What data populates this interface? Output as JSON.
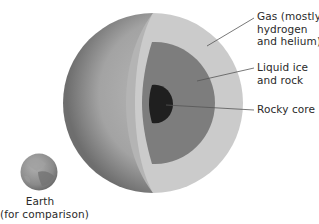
{
  "diagram": {
    "layers": [
      {
        "id": "gas",
        "label_lines": [
          "Gas (mostly",
          "hydrogen",
          "and helium)"
        ],
        "color": "#c9c9c9"
      },
      {
        "id": "mantle",
        "label_lines": [
          "Liquid ice",
          "and rock"
        ],
        "color": "#7f7f7f"
      },
      {
        "id": "core",
        "label_lines": [
          "Rocky core"
        ],
        "color": "#1e1e1e"
      }
    ],
    "comparison": {
      "label_lines": [
        "Earth",
        "(for comparison)"
      ],
      "color": "#8a8a8a"
    },
    "colors": {
      "outer_shell_dark": "#6f6f6f",
      "outer_shell_light": "#b5b5b5",
      "cut_rim": "#b9b9b9",
      "leader_line": "#555555",
      "text": "#2a2a2a"
    }
  }
}
